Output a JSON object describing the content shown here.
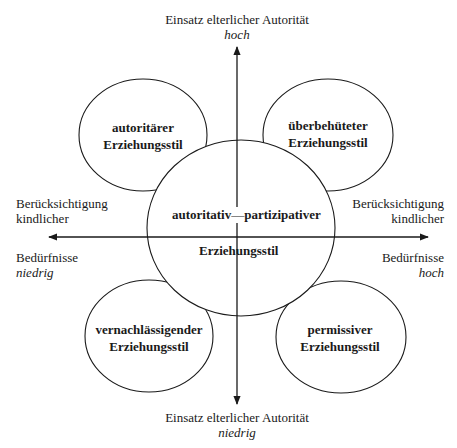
{
  "diagram": {
    "type": "quadrant-diagram",
    "axes": {
      "vertical": {
        "label": "Einsatz elterlicher Autorität",
        "high": "hoch",
        "low": "niedrig"
      },
      "horizontal": {
        "left_label_line1": "Berücksichtigung",
        "left_label_line2": "kindlicher",
        "left_label_line3": "Bedürfnisse",
        "left_value": "niedrig",
        "right_label_line1": "Berücksichtigung",
        "right_label_line2": "kindlicher",
        "right_label_line3": "Bedürfnisse",
        "right_value": "hoch"
      }
    },
    "styles": {
      "top_left": {
        "line1": "autoritärer",
        "line2": "Erziehungsstil"
      },
      "top_right": {
        "line1": "überbehüteter",
        "line2": "Erziehungsstil"
      },
      "bottom_left": {
        "line1": "vernachlässigender",
        "line2": "Erziehungsstil"
      },
      "bottom_right": {
        "line1": "permissiver",
        "line2": "Erziehungsstil"
      },
      "center": {
        "left_word": "autoritativ",
        "dash": "—",
        "right_word": "partizipativer",
        "line2": "Erziehungsstil"
      }
    },
    "colors": {
      "stroke": "#1a1a1a",
      "background": "#ffffff",
      "text": "#1a1a1a"
    }
  }
}
